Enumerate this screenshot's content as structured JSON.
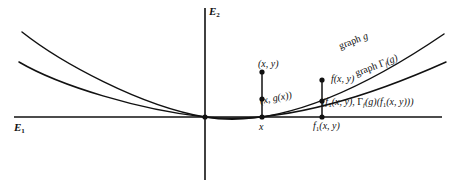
{
  "figure": {
    "kind": "mathematical-diagram",
    "background_color": "#ffffff",
    "ink_color": "#111111"
  },
  "axes": {
    "horizontal_label": "E1",
    "horizontal_label_base": "E",
    "horizontal_label_sub": "1",
    "vertical_label": "E2",
    "vertical_label_base": "E",
    "vertical_label_sub": "2"
  },
  "curves": [
    {
      "id": "graph-g",
      "label": "graph g",
      "label_prefix": "graph ",
      "label_symbol": "g",
      "description": "upper parabola through origin"
    },
    {
      "id": "graph-gamma-f-g",
      "label": "graph Γf(g)",
      "label_prefix": "graph ",
      "label_symbol": "Γ",
      "label_sub": "f",
      "label_arg": "(g)",
      "description": "lower parabola through origin"
    }
  ],
  "points": {
    "xy": {
      "label": "(x, y)",
      "open": "(",
      "var1": "x",
      "comma": ", ",
      "var2": "y",
      "close": ")"
    },
    "x_g_x": {
      "label": "(x, g(x))"
    },
    "f_xy": {
      "label": "f(x, y)"
    },
    "pair": {
      "label": "(f1(x, y), Γf(g)(f1(x, y)))"
    },
    "x_on_axis": {
      "label": "x"
    },
    "f1_xy_on_axis": {
      "label": "f1(x, y)"
    }
  }
}
